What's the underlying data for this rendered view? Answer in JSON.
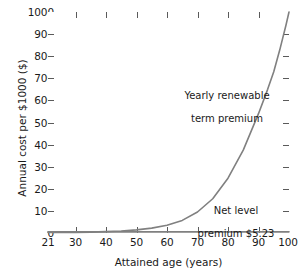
{
  "chart_data": {
    "type": "line",
    "title": "",
    "xlabel": "Attained age (years)",
    "ylabel": "Annual cost per $1000 ($)",
    "xlim": [
      21,
      100
    ],
    "ylim": [
      0,
      1000
    ],
    "xticks": [
      21,
      30,
      40,
      50,
      60,
      70,
      80,
      90,
      100
    ],
    "yticks": [
      0,
      100,
      200,
      300,
      400,
      500,
      600,
      700,
      800,
      900,
      1000
    ],
    "grid": false,
    "legend": "none",
    "annotations": [
      {
        "id": "yearly-renewable",
        "text": "Yearly renewable\nterm premium",
        "x": 76,
        "y": 620
      },
      {
        "id": "net-level",
        "text": "Net level\npremium $5.23",
        "x": 86,
        "y": 75
      }
    ],
    "series": [
      {
        "name": "Yearly renewable term premium",
        "color": "#808080",
        "x": [
          21,
          25,
          30,
          35,
          40,
          45,
          50,
          55,
          60,
          65,
          70,
          75,
          80,
          85,
          90,
          93,
          95,
          97,
          98,
          99,
          100
        ],
        "values": [
          2,
          2.5,
          3,
          4,
          6,
          9,
          14,
          22,
          35,
          57,
          95,
          155,
          248,
          375,
          540,
          650,
          730,
          830,
          885,
          940,
          1000
        ]
      },
      {
        "name": "Net level premium $5.23",
        "color": "#808080",
        "x": [
          21,
          100
        ],
        "values": [
          5.23,
          5.23
        ]
      }
    ]
  },
  "axis": {
    "y_title": "Annual cost per $1000 ($)",
    "x_title": "Attained age (years)",
    "y_tick_labels": [
      "1000",
      "900",
      "800",
      "700",
      "600",
      "500",
      "400",
      "300",
      "200",
      "100",
      "0"
    ],
    "x_tick_labels": [
      "21",
      "30",
      "40",
      "50",
      "60",
      "70",
      "80",
      "90",
      "100"
    ]
  },
  "annotations": {
    "yearly_renewable_line1": "Yearly renewable",
    "yearly_renewable_line2": "term premium",
    "net_level_line1": "Net level",
    "net_level_line2": "premium $5.23"
  },
  "colors": {
    "curve": "#808080",
    "axis": "#5a5a5a",
    "text": "#1a1a1a",
    "background": "#ffffff"
  }
}
